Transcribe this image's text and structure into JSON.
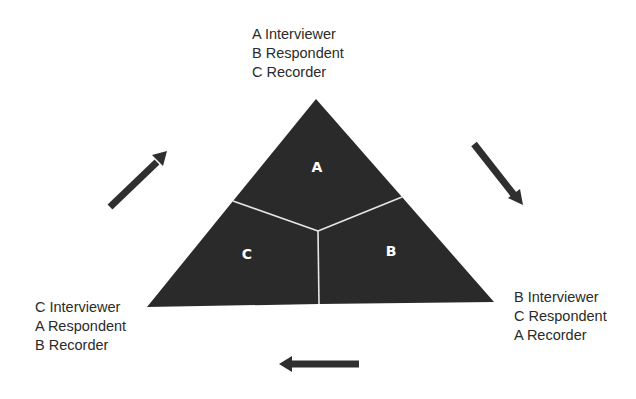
{
  "diagram": {
    "type": "rotation-triangle",
    "colors": {
      "triangle_fill": "#2a2a2a",
      "divider": "#e6e6e6",
      "segment_label": "#ffffff",
      "arrow": "#2f2f2f",
      "text": "#2b2b2b"
    },
    "segments": [
      {
        "id": "A",
        "label": "A"
      },
      {
        "id": "B",
        "label": "B"
      },
      {
        "id": "C",
        "label": "C"
      }
    ],
    "role_blocks": {
      "top": [
        "A Interviewer",
        "B Respondent",
        "C Recorder"
      ],
      "bottom_right": [
        "B Interviewer",
        "C Respondent",
        "A Recorder"
      ],
      "bottom_left": [
        "C Interviewer",
        "A Respondent",
        "B Recorder"
      ]
    },
    "arrows": [
      {
        "name": "arrow-top-left-to-top",
        "direction": "up-right"
      },
      {
        "name": "arrow-top-to-bottom-right",
        "direction": "down-right"
      },
      {
        "name": "arrow-bottom-right-to-bottom-left",
        "direction": "left"
      }
    ]
  }
}
